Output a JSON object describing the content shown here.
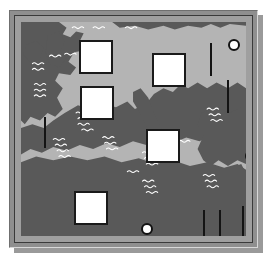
{
  "figure": {
    "kind": "map-plot",
    "caption": "",
    "frame": {
      "outer_color": "#8f8f8f",
      "inner_line_color": "#3a3a3a",
      "shadow_color": "#9a9a9a",
      "page_background": "#ffffff"
    }
  },
  "map": {
    "region_name": "Europe and Mediterranean",
    "projection_note": "plan view, north up",
    "colors": {
      "sea": "#b4b4b4",
      "land": "#595959",
      "land_edge": "#4d4d4d",
      "hatch": "#ffffff",
      "marker_fill": "#ffffff",
      "marker_stroke": "#1a1a1a",
      "bar": "#141414"
    },
    "land_masses": [
      {
        "name": "british-isles-and-northwest-europe"
      },
      {
        "name": "scandinavia-and-baltic"
      },
      {
        "name": "iberia-and-france"
      },
      {
        "name": "italy-and-balkans"
      },
      {
        "name": "anatolia-and-levant"
      },
      {
        "name": "north-africa"
      }
    ],
    "hatch_marks": {
      "glyph": "wave-hatch",
      "count": 34,
      "description": "small white wavy tick clusters scattered over land areas"
    }
  },
  "markers": {
    "squares": {
      "label": "white-square-marker",
      "count": 5,
      "items": [
        {
          "id": "sq-1",
          "x": 58,
          "y": 18,
          "size": 34
        },
        {
          "id": "sq-2",
          "x": 59,
          "y": 64,
          "size": 34
        },
        {
          "id": "sq-3",
          "x": 131,
          "y": 31,
          "size": 34
        },
        {
          "id": "sq-4",
          "x": 125,
          "y": 107,
          "size": 34
        },
        {
          "id": "sq-5",
          "x": 53,
          "y": 169,
          "size": 34
        }
      ]
    },
    "circles": {
      "label": "white-circle-marker",
      "count": 3,
      "items": [
        {
          "id": "ci-1",
          "cx": 213,
          "cy": 23,
          "r": 6
        },
        {
          "id": "ci-2",
          "cx": 230,
          "cy": 134,
          "r": 6
        },
        {
          "id": "ci-3",
          "cx": 126,
          "cy": 207,
          "r": 6
        }
      ]
    },
    "bars": {
      "label": "vertical-bar-marker",
      "count": 6,
      "items": [
        {
          "id": "bar-1",
          "x": 23,
          "y": 95,
          "w": 2,
          "h": 31
        },
        {
          "id": "bar-2",
          "x": 189,
          "y": 21,
          "w": 2,
          "h": 33
        },
        {
          "id": "bar-3",
          "x": 206,
          "y": 58,
          "w": 2,
          "h": 33
        },
        {
          "id": "bar-4",
          "x": 182,
          "y": 188,
          "w": 2,
          "h": 31
        },
        {
          "id": "bar-5",
          "x": 198,
          "y": 188,
          "w": 2,
          "h": 31
        },
        {
          "id": "bar-6",
          "x": 221,
          "y": 184,
          "w": 2,
          "h": 35
        }
      ]
    }
  },
  "footer_strip": {
    "text": ""
  }
}
